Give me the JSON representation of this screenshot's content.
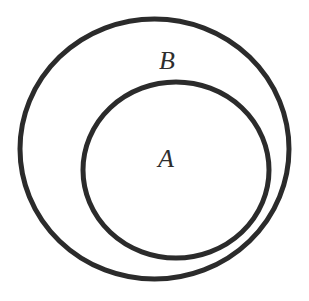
{
  "diagram": {
    "type": "venn",
    "relationship": "A is a subset of B",
    "background_color": "#ffffff",
    "stroke_color": "#2b2b2b",
    "sets": [
      {
        "id": "B",
        "label": "B",
        "role": "outer",
        "shape": {
          "cx": 154.5,
          "cy": 149,
          "rx": 134.5,
          "ry": 130,
          "stroke_width": 5
        },
        "label_position": {
          "x": 167,
          "y": 69
        }
      },
      {
        "id": "A",
        "label": "A",
        "role": "inner",
        "shape": {
          "cx": 176,
          "cy": 170,
          "rx": 93,
          "ry": 88,
          "stroke_width": 5
        },
        "label_position": {
          "x": 166,
          "y": 167
        }
      }
    ]
  }
}
